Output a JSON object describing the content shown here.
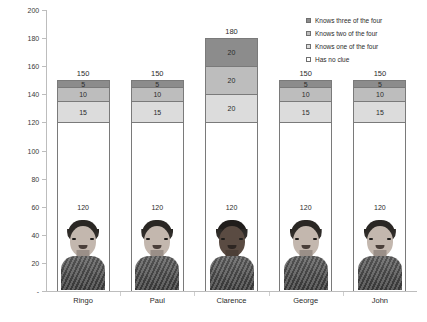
{
  "chart_data": {
    "type": "bar",
    "subtype": "stacked-bar",
    "title": "",
    "xlabel": "",
    "ylabel": "",
    "ylim": [
      0,
      200
    ],
    "ytick_step": 20,
    "yticks": [
      0,
      20,
      40,
      60,
      80,
      100,
      120,
      140,
      160,
      180,
      200
    ],
    "ytick_labels": [
      "-",
      "20",
      "40",
      "60",
      "80",
      "100",
      "120",
      "140",
      "160",
      "180",
      "200"
    ],
    "grid": false,
    "legend_position": "top-right",
    "categories": [
      "Ringo",
      "Paul",
      "Clarence",
      "George",
      "John"
    ],
    "totals": [
      150,
      150,
      180,
      150,
      150
    ],
    "series": [
      {
        "name": "Has no clue",
        "key": "s0",
        "color": "#ffffff",
        "values": [
          120,
          120,
          120,
          120,
          120
        ]
      },
      {
        "name": "Knows one of the four",
        "key": "s1",
        "color": "#dcdcdc",
        "values": [
          15,
          15,
          20,
          15,
          15
        ]
      },
      {
        "name": "Knows two of the four",
        "key": "s2",
        "color": "#bdbdbd",
        "values": [
          10,
          10,
          20,
          10,
          10
        ]
      },
      {
        "name": "Knows three of the four",
        "key": "s3",
        "color": "#8c8c8c",
        "values": [
          5,
          5,
          20,
          5,
          5
        ]
      }
    ],
    "legend": [
      {
        "label": "Knows three of the four",
        "swatch": "sw3"
      },
      {
        "label": "Knows two of the four",
        "swatch": "sw2"
      },
      {
        "label": "Knows one of the four",
        "swatch": "sw1"
      },
      {
        "label": "Has no clue",
        "swatch": "sw0"
      }
    ],
    "portraits": [
      {
        "category": "Ringo",
        "tone": "light"
      },
      {
        "category": "Paul",
        "tone": "light"
      },
      {
        "category": "Clarence",
        "tone": "dark"
      },
      {
        "category": "George",
        "tone": "light"
      },
      {
        "category": "John",
        "tone": "light"
      }
    ],
    "axis_color": "#bdbdbd",
    "bar_border_color": "#7a7a7a",
    "text_color": "#2b2b2b"
  }
}
